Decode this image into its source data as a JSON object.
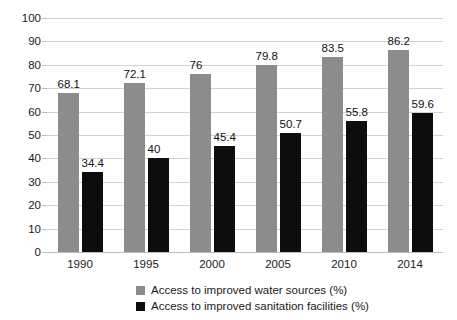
{
  "chart_data": {
    "type": "bar",
    "title": "",
    "subtitle": "",
    "xlabel": "",
    "ylabel": "",
    "ylim": [
      0,
      100
    ],
    "ytick_step": 10,
    "yticks": [
      0,
      10,
      20,
      30,
      40,
      50,
      60,
      70,
      80,
      90,
      100
    ],
    "grid": true,
    "legend_position": "bottom",
    "categories": [
      "1990",
      "1995",
      "2000",
      "2005",
      "2010",
      "2014"
    ],
    "series": [
      {
        "name": "Access to improved water sources (%)",
        "color": "#8c8c8c",
        "values": [
          68.1,
          72.1,
          76,
          79.8,
          83.5,
          86.2
        ],
        "labels": [
          "68.1",
          "72.1",
          "76",
          "79.8",
          "83.5",
          "86.2"
        ]
      },
      {
        "name": "Access to improved sanitation facilities (%)",
        "color": "#0d0d0d",
        "values": [
          34.4,
          40,
          45.4,
          50.7,
          55.8,
          59.6
        ],
        "labels": [
          "34.4",
          "40",
          "45.4",
          "50.7",
          "55.8",
          "59.6"
        ]
      }
    ]
  },
  "colors": {
    "series_a": "#8c8c8c",
    "series_b": "#0d0d0d",
    "gridline": "#d2d2d2",
    "axis": "#bdbdbd",
    "text": "#1a1a1a",
    "background": "#ffffff"
  }
}
